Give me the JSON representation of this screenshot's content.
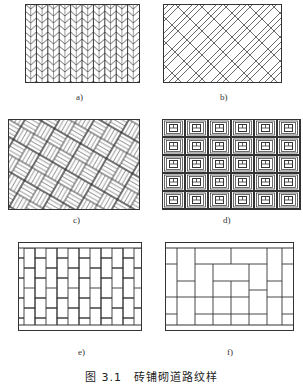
{
  "figure": {
    "caption": "图 3.1　砖铺砌道路纹样",
    "stroke_color": "#333333",
    "background": "#ffffff",
    "panels": [
      {
        "id": "a",
        "label": "a)",
        "pattern": "herringbone-vertical-columns"
      },
      {
        "id": "b",
        "label": "b)",
        "pattern": "herringbone-diagonal"
      },
      {
        "id": "c",
        "label": "c)",
        "pattern": "basketweave-diagonal"
      },
      {
        "id": "d",
        "label": "d)",
        "pattern": "concentric-square-tiles",
        "grid": {
          "cols": 6,
          "rows": 5
        }
      },
      {
        "id": "e",
        "label": "e)",
        "pattern": "running-bond-vertical"
      },
      {
        "id": "f",
        "label": "f)",
        "pattern": "pinwheel-rectangles"
      }
    ]
  }
}
